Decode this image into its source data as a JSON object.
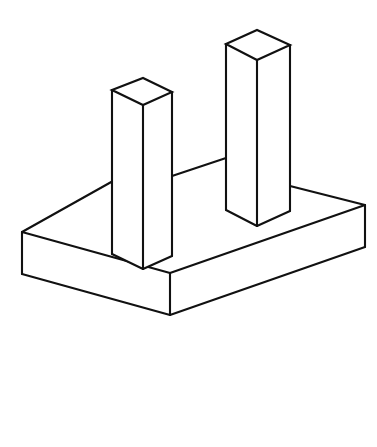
{
  "document": {
    "title": "Isometric Line Drawing",
    "subject": "H-shaped bracket on rectangular base plate",
    "background_color": "#ffffff",
    "line_color": "#111111",
    "fill_color": "#ffffff",
    "canvas": {
      "width": 377,
      "height": 447
    }
  },
  "drawing": {
    "projection": "isometric",
    "stroke_width": 2.1,
    "parts": [
      {
        "name": "base-plate",
        "label": "Base Plate",
        "shape": "rectangular slab",
        "top_face_vertices": [
          [
            22,
            232
          ],
          [
            138,
            167
          ],
          [
            365,
            205
          ],
          [
            170,
            273
          ]
        ],
        "thickness_px": 42
      },
      {
        "name": "left-column",
        "label": "Left Column",
        "shape": "vertical rectangular prism",
        "top_face_vertices": [
          [
            112,
            90
          ],
          [
            143,
            78
          ],
          [
            172,
            92
          ],
          [
            143,
            105
          ]
        ],
        "height_px": 164,
        "base_center": [
          143,
          255
        ]
      },
      {
        "name": "right-column",
        "label": "Right Column",
        "shape": "vertical rectangular prism",
        "top_face_vertices": [
          [
            226,
            44
          ],
          [
            257,
            30
          ],
          [
            290,
            45
          ],
          [
            257,
            60
          ]
        ],
        "height_px": 166,
        "base_center": [
          257,
          210
        ]
      },
      {
        "name": "cross-bar",
        "label": "Connecting Cross Bar",
        "shape": "thin horizontal web",
        "from": [
          172,
          176
        ],
        "to": [
          226,
          158
        ]
      }
    ]
  }
}
